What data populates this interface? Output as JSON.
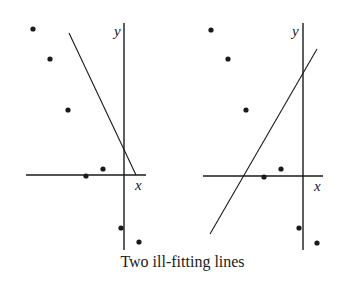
{
  "caption": "Two ill-fitting lines",
  "colors": {
    "ink": "#1a1a1a",
    "background": "#ffffff"
  },
  "panels": [
    {
      "name": "left",
      "axis_labels": {
        "x": "x",
        "y": "y"
      },
      "points": [
        [
          33,
          29
        ],
        [
          50,
          59
        ],
        [
          68,
          110
        ],
        [
          86,
          176
        ],
        [
          103,
          169
        ],
        [
          121,
          228
        ],
        [
          139,
          242
        ]
      ],
      "line": [
        [
          69,
          33
        ],
        [
          136,
          175
        ]
      ],
      "y_axis": [
        [
          124,
          23
        ],
        [
          124,
          250
        ]
      ],
      "x_axis": [
        [
          26,
          175
        ],
        [
          146,
          175
        ]
      ],
      "y_label_pos": [
        114,
        36
      ],
      "x_label_pos": [
        135,
        190
      ]
    },
    {
      "name": "right",
      "axis_labels": {
        "x": "x",
        "y": "y"
      },
      "points": [
        [
          211,
          30
        ],
        [
          228,
          59
        ],
        [
          246,
          110
        ],
        [
          264,
          177
        ],
        [
          281,
          169
        ],
        [
          299,
          228
        ],
        [
          317,
          243
        ]
      ],
      "line": [
        [
          210,
          234
        ],
        [
          317,
          49
        ]
      ],
      "y_axis": [
        [
          303,
          23
        ],
        [
          303,
          250
        ]
      ],
      "x_axis": [
        [
          203,
          176
        ],
        [
          323,
          176
        ]
      ],
      "y_label_pos": [
        292,
        36
      ],
      "x_label_pos": [
        314,
        191
      ]
    }
  ]
}
